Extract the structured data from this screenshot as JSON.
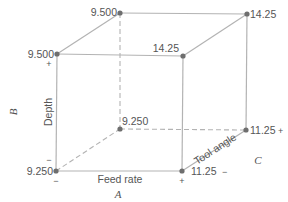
{
  "diagram": {
    "type": "cube-factorial-design",
    "factors": {
      "A": {
        "letter": "A",
        "name": "Feed rate",
        "low": "−",
        "high": "+"
      },
      "B": {
        "letter": "B",
        "name": "Depth",
        "low": "−",
        "high": "+"
      },
      "C": {
        "letter": "C",
        "name": "Tool angle",
        "low": "−",
        "high": "+"
      }
    },
    "vertices": {
      "front_bottom_left": "9.250",
      "front_top_left": "9.500",
      "back_top_left": "9.500",
      "back_bottom_left": "9.250",
      "front_top_right": "14.25",
      "back_top_right": "14.25",
      "back_bottom_right": "11.25",
      "front_bottom_right": "11.25"
    },
    "signs": {
      "left_top_plus": "+",
      "left_bottom_minus_top": "−",
      "left_bottom_minus_below": "−",
      "bottom_right_plus": "+",
      "back_right_plus": "+",
      "front_right_minus": "−"
    }
  }
}
